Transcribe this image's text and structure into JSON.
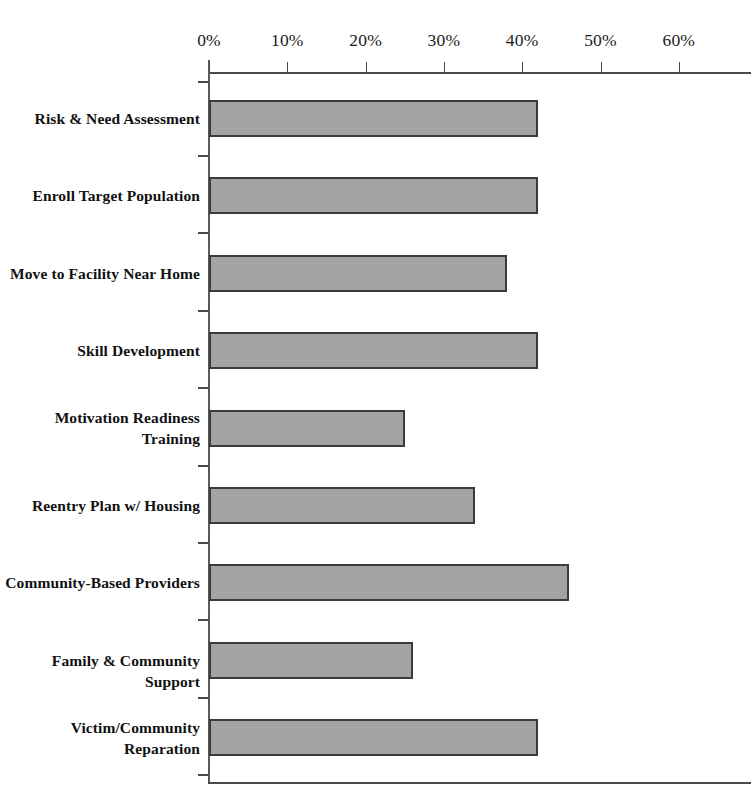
{
  "chart_data": {
    "type": "bar",
    "orientation": "horizontal",
    "title": "",
    "xlabel": "",
    "ylabel": "",
    "xlim": [
      0,
      70
    ],
    "grid": false,
    "legend": false,
    "bar_color": "#a3a3a3",
    "bar_border_color": "#3c3c3c",
    "axis_color": "#4a4a4a",
    "x_tick_labels": [
      "0%",
      "10%",
      "20%",
      "30%",
      "40%",
      "50%",
      "60%",
      "7"
    ],
    "x_tick_values": [
      0,
      10,
      20,
      30,
      40,
      50,
      60,
      70
    ],
    "categories": [
      "Risk & Need Assessment",
      "Enroll Target Population",
      "Move to Facility Near Home",
      "Skill Development",
      "Motivation Readiness\nTraining",
      "Reentry Plan w/ Housing",
      "Community-Based Providers",
      "Family & Community Support",
      "Victim/Community\nReparation"
    ],
    "values": [
      42,
      42,
      38,
      42,
      25,
      34,
      46,
      26,
      42
    ]
  }
}
